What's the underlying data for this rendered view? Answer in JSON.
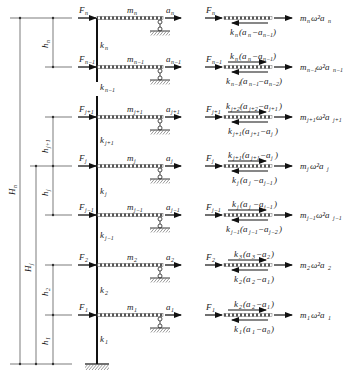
{
  "diagram": {
    "type": "multi-story shear frame with free-body diagrams",
    "levels": [
      {
        "id": "n",
        "y": 18,
        "force": "F",
        "force_sub": "n",
        "mass": "m",
        "mass_sub": "n",
        "disp": "a",
        "disp_sub": "n",
        "story_stiff": "k",
        "story_stiff_sub": "n",
        "fbd_top": "",
        "fbd_bottom": "k_n(a_n − a_{n−1})",
        "inertia": "m_n ω² a_n"
      },
      {
        "id": "n-1",
        "y": 67,
        "force": "F",
        "force_sub": "n−1",
        "mass": "m",
        "mass_sub": "n−1",
        "disp": "a",
        "disp_sub": "n−1",
        "story_stiff": "k",
        "story_stiff_sub": "n−1",
        "fbd_top": "k_n(a_n − a_{n−1})",
        "fbd_bottom": "k_{n−1}(a_{n−1} − a_{n−2})",
        "inertia": "m_{n−1} ω² a_{n−1}"
      },
      {
        "id": "j+1",
        "y": 117,
        "force": "F",
        "force_sub": "j+1",
        "mass": "m",
        "mass_sub": "j+1",
        "disp": "a",
        "disp_sub": "j+1",
        "story_stiff": "k",
        "story_stiff_sub": "j+1",
        "fbd_top": "k_{j+2}(a_{j+2} − a_{j+1})",
        "fbd_bottom": "k_{j+1}(a_{j+1} − a_j)",
        "inertia": "m_{j+1} ω² a_{j+1}"
      },
      {
        "id": "j",
        "y": 166,
        "force": "F",
        "force_sub": "j",
        "mass": "m",
        "mass_sub": "j",
        "disp": "a",
        "disp_sub": "j",
        "story_stiff": "k",
        "story_stiff_sub": "j",
        "fbd_top": "k_{j+1}(a_{j+1} − a_j)",
        "fbd_bottom": "k_j(a_j − a_{j−1})",
        "inertia": "m_j ω² a_j"
      },
      {
        "id": "j-1",
        "y": 215,
        "force": "F",
        "force_sub": "j−1",
        "mass": "m",
        "mass_sub": "j−1",
        "disp": "a",
        "disp_sub": "j−1",
        "story_stiff": "k",
        "story_stiff_sub": "j−1",
        "fbd_top": "k_j(a_j − a_{j−1})",
        "fbd_bottom": "k_{j−1}(a_{j−1} − a_{j−2})",
        "inertia": "m_{j−1} ω² a_{j−1}"
      },
      {
        "id": "2",
        "y": 265,
        "force": "F",
        "force_sub": "2",
        "mass": "m",
        "mass_sub": "2",
        "disp": "a",
        "disp_sub": "2",
        "story_stiff": "k",
        "story_stiff_sub": "2",
        "fbd_top": "k_3(a_3 − a_2)",
        "fbd_bottom": "k_2(a_2 − a_1)",
        "inertia": "m_2 ω² a_2"
      },
      {
        "id": "1",
        "y": 315,
        "force": "F",
        "force_sub": "1",
        "mass": "m",
        "mass_sub": "1",
        "disp": "a",
        "disp_sub": "1",
        "story_stiff": "k",
        "story_stiff_sub": "1",
        "fbd_top": "k_2(a_2 − a_1)",
        "fbd_bottom": "k_1(a_1 − a_0)",
        "inertia": "m_1 ω² a_1"
      }
    ],
    "base_y": 364,
    "dimensions": {
      "total_height": {
        "label": "H",
        "sub": "n"
      },
      "partial_height": {
        "label": "H",
        "sub": "j"
      },
      "story_heights": [
        {
          "label": "h",
          "sub": "n"
        },
        {
          "label": "h",
          "sub": "j+1"
        },
        {
          "label": "h",
          "sub": "j"
        },
        {
          "label": "h",
          "sub": "2"
        },
        {
          "label": "h",
          "sub": "1"
        }
      ]
    },
    "labels": {
      "F": "F",
      "m": "m",
      "a": "a",
      "k": "k",
      "H": "H",
      "h": "h",
      "omega_sq": "ω²"
    }
  }
}
